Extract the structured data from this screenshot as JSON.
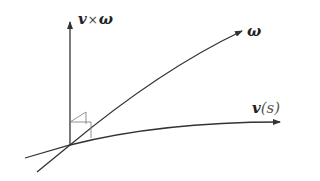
{
  "diagram": {
    "type": "vector-frame",
    "labels": {
      "vertical_axis": {
        "v": "v",
        "times": "×",
        "omega": "ω"
      },
      "omega_axis": "ω",
      "curve": {
        "v": "v",
        "open": "(",
        "s": "s",
        "close": ")"
      }
    },
    "colors": {
      "stroke": "#333333",
      "text": "#222222",
      "marker": "#666666"
    },
    "elements": [
      "vertical arrow labeled v×ω",
      "arrow labeled ω",
      "curve arrow labeled v(s)",
      "right-angle marker at origin"
    ]
  }
}
